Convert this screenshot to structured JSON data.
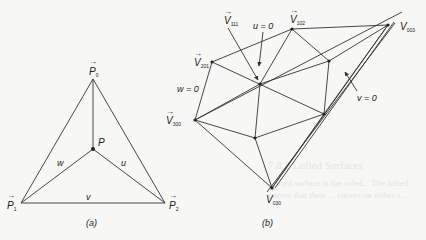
{
  "figure_a": {
    "caption": "(a)",
    "points": {
      "P0": {
        "label": "P",
        "sub": "0"
      },
      "P1": {
        "label": "P",
        "sub": "1"
      },
      "P2": {
        "label": "P",
        "sub": "2"
      },
      "P": {
        "label": "P"
      }
    },
    "edge_labels": {
      "w": "w",
      "u": "u",
      "v": "v"
    }
  },
  "figure_b": {
    "caption": "(b)",
    "vertices": {
      "V111": {
        "label": "V",
        "sub": "111"
      },
      "V102": {
        "label": "V",
        "sub": "102"
      },
      "V003": {
        "label": "V",
        "sub": "003"
      },
      "V201": {
        "label": "V",
        "sub": "201"
      },
      "V300": {
        "label": "V",
        "sub": "300"
      },
      "V030": {
        "label": "V",
        "sub": "030"
      }
    },
    "annotations": {
      "u0": "u = 0",
      "w0": "w = 0",
      "v0": "v = 0"
    }
  },
  "background_text": {
    "line1": "7.8.2 Lofted Surfaces",
    "line2": "Lofted surface is the ruled... The lofted",
    "line3": "curves that their ... curves on either s..."
  },
  "colors": {
    "line": "#333333",
    "text": "#222222",
    "background": "#f7f7f5"
  }
}
